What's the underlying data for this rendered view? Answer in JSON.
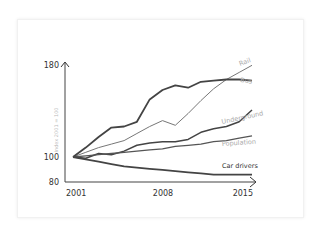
{
  "chart_data": {
    "type": "line",
    "title": "",
    "xlabel": "",
    "ylabel": "Index 2001 = 100",
    "x": [
      2001,
      2002,
      2003,
      2004,
      2005,
      2006,
      2007,
      2008,
      2009,
      2010,
      2011,
      2012,
      2013,
      2014,
      2015
    ],
    "x_tick_labels": [
      "2001",
      "2008",
      "2015"
    ],
    "y_tick_labels": [
      "80",
      "100",
      "180"
    ],
    "ylim": [
      80,
      180
    ],
    "grid": false,
    "legend": "inline labels at line ends",
    "series": [
      {
        "name": "Rail",
        "color": "#777777",
        "values": [
          100,
          104,
          108,
          111,
          114,
          120,
          126,
          131,
          127,
          137,
          148,
          158,
          166,
          172,
          178
        ]
      },
      {
        "name": "Bus",
        "color": "#444444",
        "values": [
          100,
          108,
          117,
          125,
          126,
          130,
          149,
          157,
          161,
          159,
          164,
          165,
          166,
          166,
          165
        ]
      },
      {
        "name": "Underground",
        "color": "#444444",
        "values": [
          100,
          99,
          103,
          102,
          105,
          110,
          112,
          113,
          113,
          115,
          121,
          124,
          126,
          130,
          140
        ]
      },
      {
        "name": "Population",
        "color": "#555555",
        "values": [
          100,
          101,
          102,
          103,
          104,
          105,
          106,
          107,
          109,
          110,
          111,
          113,
          114,
          116,
          118
        ]
      },
      {
        "name": "Car drivers",
        "color": "#444444",
        "values": [
          100,
          98,
          96,
          94,
          92,
          91,
          90,
          89,
          88,
          87,
          86,
          85,
          85,
          85,
          85
        ]
      }
    ]
  },
  "axes": {
    "y_top": "180",
    "y_100": "100",
    "y_bottom": "80",
    "ylabel": "Index 2001 = 100",
    "x_start": "2001",
    "x_mid": "2008",
    "x_end": "2015"
  },
  "labels": {
    "rail": "Rail",
    "bus": "Bus",
    "underground": "Underground",
    "population": "Population",
    "car_drivers": "Car drivers"
  }
}
